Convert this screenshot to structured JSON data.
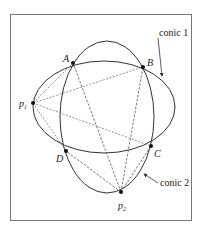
{
  "diagram": {
    "type": "two-conics-intersection",
    "frame": {
      "x": 10,
      "y": 14,
      "width": 181,
      "height": 206
    },
    "points": {
      "A": {
        "label": "A",
        "x": 73,
        "y": 63
      },
      "B": {
        "label": "B",
        "x": 143,
        "y": 67
      },
      "C": {
        "label": "C",
        "x": 151,
        "y": 146
      },
      "D": {
        "label": "D",
        "x": 66,
        "y": 151
      },
      "p1": {
        "label": "p",
        "sub": "1",
        "x": 33,
        "y": 103
      },
      "p2": {
        "label": "p",
        "sub": "2",
        "x": 121,
        "y": 192
      }
    },
    "conics": [
      {
        "name": "conic 1",
        "label": "conic 1",
        "cx": 104,
        "cy": 107,
        "rx": 71,
        "ry": 47
      },
      {
        "name": "conic 2",
        "label": "conic 2",
        "cx": 107,
        "cy": 116,
        "rx": 47,
        "ry": 77
      }
    ],
    "annotations": {
      "conic1_label": "conic 1",
      "conic2_label": "conic 2"
    },
    "edges": {
      "from_p1": [
        "A",
        "B",
        "C",
        "D"
      ],
      "from_p2": [
        "A",
        "B",
        "C",
        "D"
      ]
    },
    "colors": {
      "stroke": "#333333",
      "dashed": "#555555",
      "frame": "#777777"
    }
  }
}
